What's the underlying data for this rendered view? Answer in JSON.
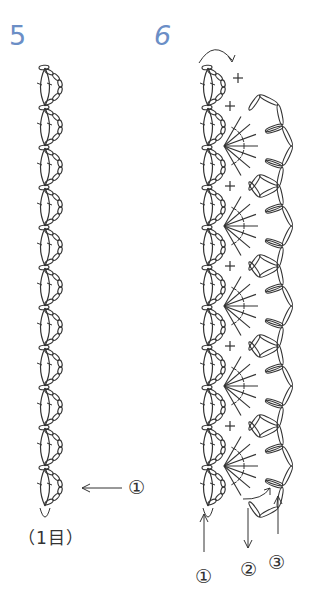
{
  "figures": [
    {
      "number": "5",
      "motif_count": 11,
      "labels": {
        "arrow_row": "①",
        "stitch_note": "（1目）"
      }
    },
    {
      "number": "6",
      "motif_count": 11,
      "labels": {
        "row1": "①",
        "row2": "②",
        "row3": "③"
      }
    }
  ],
  "colors": {
    "figure_number": "#6b8ec6",
    "stroke": "#333333",
    "background": "#ffffff"
  },
  "layout": {
    "fig5": {
      "x": 45,
      "y_start": 68,
      "pitch": 40
    },
    "fig6": {
      "x": 208,
      "y_start": 68,
      "pitch": 40
    }
  }
}
